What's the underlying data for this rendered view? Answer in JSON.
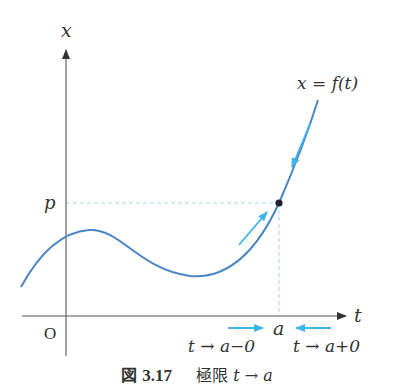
{
  "figure": {
    "caption": {
      "label_kanji": "図",
      "number": "3.17",
      "title_kanji": "極限",
      "title_math": "t → a"
    },
    "axes": {
      "vertical_label": "x",
      "horizontal_label": "t",
      "origin_label": "O"
    },
    "curve_label": "x = f(t)",
    "point": {
      "x_value_label": "a",
      "y_value_label": "p"
    },
    "approach_labels": {
      "left": "t → a−0",
      "right": "t → a+0"
    },
    "colors": {
      "curve": "#4a86c5",
      "arrows": "#3fb4e8",
      "dashed": "#9fd8ef",
      "axis": "#555555",
      "point": "#222233"
    }
  }
}
